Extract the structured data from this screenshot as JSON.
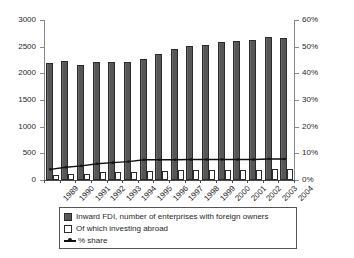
{
  "chart_data": {
    "type": "bar",
    "title": "",
    "xlabel": "",
    "ylabel": "",
    "categories": [
      "1989",
      "1990",
      "1991",
      "1992",
      "1993",
      "1994",
      "1995",
      "1996",
      "1997",
      "1998",
      "1999",
      "2000",
      "2001",
      "2002",
      "2003",
      "2004"
    ],
    "series": [
      {
        "name": "Inward FDI, number of enterprises with foreign owners",
        "type": "bar",
        "axis": "left",
        "color": "#565656",
        "values": [
          2190,
          2225,
          2160,
          2205,
          2205,
          2210,
          2260,
          2360,
          2465,
          2520,
          2535,
          2580,
          2605,
          2630,
          2680,
          2660
        ]
      },
      {
        "name": "Of which investing abroad",
        "type": "bar",
        "axis": "left",
        "color": "#ffffff",
        "values": [
          85,
          110,
          115,
          145,
          150,
          155,
          165,
          175,
          185,
          180,
          180,
          185,
          195,
          195,
          205,
          210
        ]
      },
      {
        "name": "% share",
        "type": "line",
        "axis": "right",
        "color": "#111111",
        "values": [
          4.0,
          4.8,
          5.3,
          6.1,
          6.5,
          6.9,
          7.6,
          7.6,
          7.6,
          7.7,
          7.7,
          7.7,
          7.7,
          7.7,
          7.9,
          7.9
        ]
      }
    ],
    "left_axis": {
      "ylim": [
        0,
        3000
      ],
      "ticks": [
        0,
        500,
        1000,
        1500,
        2000,
        2500,
        3000
      ],
      "tick_labels": [
        "0",
        "500",
        "1000",
        "1500",
        "2000",
        "2500",
        "3000"
      ]
    },
    "right_axis": {
      "ylim": [
        0,
        60
      ],
      "ticks": [
        0,
        10,
        20,
        30,
        40,
        50,
        60
      ],
      "tick_labels": [
        "0%",
        "10%",
        "20%",
        "30%",
        "40%",
        "50%",
        "60%"
      ]
    },
    "grid": false,
    "legend_position": "bottom",
    "legend": [
      {
        "label": "Inward FDI, number of enterprises with foreign owners",
        "marker": "filled-square",
        "color": "#565656"
      },
      {
        "label": "Of which investing abroad",
        "marker": "open-square",
        "color": "#ffffff"
      },
      {
        "label": "% share",
        "marker": "line-with-dot",
        "color": "#111111"
      }
    ]
  }
}
